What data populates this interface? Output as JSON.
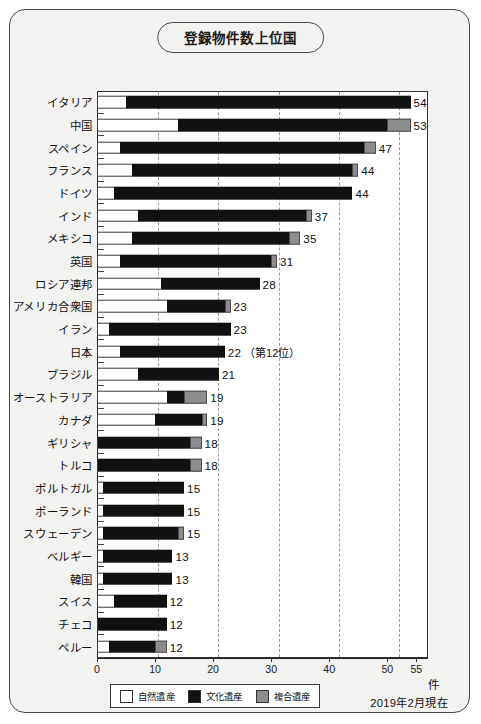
{
  "title": "登録物件数上位国",
  "footnote": "2019年2月現在",
  "unit": "件",
  "legend": [
    {
      "key": "natural",
      "label": "自然遺産",
      "color": "#ffffff"
    },
    {
      "key": "cultural",
      "label": "文化遺産",
      "color": "#111111"
    },
    {
      "key": "mixed",
      "label": "複合遺産",
      "color": "#8d8d8d"
    }
  ],
  "chart_data": {
    "type": "bar",
    "orientation": "horizontal",
    "stacked": true,
    "title": "登録物件数上位国",
    "xlabel": "件",
    "ylabel": "",
    "xlim": [
      0,
      57
    ],
    "grid": true,
    "xticks": [
      0,
      10,
      20,
      30,
      40,
      50,
      55
    ],
    "xtick_labels": [
      "0",
      "10",
      "20",
      "30",
      "40",
      "50",
      "55"
    ],
    "legend_position": "bottom-left",
    "series": [
      {
        "name": "自然遺産",
        "color": "#ffffff",
        "values": [
          5,
          14,
          4,
          6,
          3,
          7,
          6,
          4,
          11,
          12,
          2,
          4,
          7,
          12,
          10,
          0,
          0,
          1,
          1,
          1,
          1,
          1,
          3,
          0,
          2
        ]
      },
      {
        "name": "文化遺産",
        "color": "#111111",
        "values": [
          49,
          36,
          42,
          38,
          41,
          29,
          27,
          26,
          17,
          10,
          21,
          18,
          14,
          3,
          8,
          16,
          16,
          14,
          14,
          13,
          12,
          12,
          9,
          12,
          8
        ]
      },
      {
        "name": "複合遺産",
        "color": "#8d8d8d",
        "values": [
          0,
          4,
          2,
          1,
          0,
          1,
          2,
          1,
          0,
          1,
          0,
          0,
          0,
          4,
          1,
          2,
          2,
          0,
          0,
          1,
          0,
          0,
          0,
          0,
          2
        ]
      }
    ],
    "categories": [
      "イタリア",
      "中国",
      "スペイン",
      "フランス",
      "ドイツ",
      "インド",
      "メキシコ",
      "英国",
      "ロシア連邦",
      "アメリカ合衆国",
      "イラン",
      "日本",
      "ブラジル",
      "オーストラリア",
      "カナダ",
      "ギリシャ",
      "トルコ",
      "ポルトガル",
      "ポーランド",
      "スウェーデン",
      "ベルギー",
      "韓国",
      "スイス",
      "チェコ",
      "ペルー"
    ],
    "totals": [
      54,
      53,
      47,
      44,
      44,
      37,
      35,
      31,
      28,
      23,
      23,
      22,
      21,
      19,
      19,
      18,
      18,
      15,
      15,
      15,
      13,
      13,
      12,
      12,
      12
    ]
  },
  "rows": [
    {
      "label": "イタリア",
      "natural": 5,
      "cultural": 49,
      "mixed": 0,
      "total_label": "54",
      "note": ""
    },
    {
      "label": "中国",
      "natural": 14,
      "cultural": 36,
      "mixed": 4,
      "total_label": "53",
      "note": ""
    },
    {
      "label": "スペイン",
      "natural": 4,
      "cultural": 42,
      "mixed": 2,
      "total_label": "47",
      "note": ""
    },
    {
      "label": "フランス",
      "natural": 6,
      "cultural": 38,
      "mixed": 1,
      "total_label": "44",
      "note": ""
    },
    {
      "label": "ドイツ",
      "natural": 3,
      "cultural": 41,
      "mixed": 0,
      "total_label": "44",
      "note": ""
    },
    {
      "label": "インド",
      "natural": 7,
      "cultural": 29,
      "mixed": 1,
      "total_label": "37",
      "note": ""
    },
    {
      "label": "メキシコ",
      "natural": 6,
      "cultural": 27,
      "mixed": 2,
      "total_label": "35",
      "note": ""
    },
    {
      "label": "英国",
      "natural": 4,
      "cultural": 26,
      "mixed": 1,
      "total_label": "31",
      "note": ""
    },
    {
      "label": "ロシア連邦",
      "natural": 11,
      "cultural": 17,
      "mixed": 0,
      "total_label": "28",
      "note": ""
    },
    {
      "label": "アメリカ合衆国",
      "natural": 12,
      "cultural": 10,
      "mixed": 1,
      "total_label": "23",
      "note": ""
    },
    {
      "label": "イラン",
      "natural": 2,
      "cultural": 21,
      "mixed": 0,
      "total_label": "23",
      "note": ""
    },
    {
      "label": "日本",
      "natural": 4,
      "cultural": 18,
      "mixed": 0,
      "total_label": "22",
      "note": "（第12位）"
    },
    {
      "label": "ブラジル",
      "natural": 7,
      "cultural": 14,
      "mixed": 0,
      "total_label": "21",
      "note": ""
    },
    {
      "label": "オーストラリア",
      "natural": 12,
      "cultural": 3,
      "mixed": 4,
      "total_label": "19",
      "note": ""
    },
    {
      "label": "カナダ",
      "natural": 10,
      "cultural": 8,
      "mixed": 1,
      "total_label": "19",
      "note": ""
    },
    {
      "label": "ギリシャ",
      "natural": 0,
      "cultural": 16,
      "mixed": 2,
      "total_label": "18",
      "note": ""
    },
    {
      "label": "トルコ",
      "natural": 0,
      "cultural": 16,
      "mixed": 2,
      "total_label": "18",
      "note": ""
    },
    {
      "label": "ポルトガル",
      "natural": 1,
      "cultural": 14,
      "mixed": 0,
      "total_label": "15",
      "note": ""
    },
    {
      "label": "ポーランド",
      "natural": 1,
      "cultural": 14,
      "mixed": 0,
      "total_label": "15",
      "note": ""
    },
    {
      "label": "スウェーデン",
      "natural": 1,
      "cultural": 13,
      "mixed": 1,
      "total_label": "15",
      "note": ""
    },
    {
      "label": "ベルギー",
      "natural": 1,
      "cultural": 12,
      "mixed": 0,
      "total_label": "13",
      "note": ""
    },
    {
      "label": "韓国",
      "natural": 1,
      "cultural": 12,
      "mixed": 0,
      "total_label": "13",
      "note": ""
    },
    {
      "label": "スイス",
      "natural": 3,
      "cultural": 9,
      "mixed": 0,
      "total_label": "12",
      "note": ""
    },
    {
      "label": "チェコ",
      "natural": 0,
      "cultural": 12,
      "mixed": 0,
      "total_label": "12",
      "note": ""
    },
    {
      "label": "ペルー",
      "natural": 2,
      "cultural": 8,
      "mixed": 2,
      "total_label": "12",
      "note": ""
    }
  ]
}
